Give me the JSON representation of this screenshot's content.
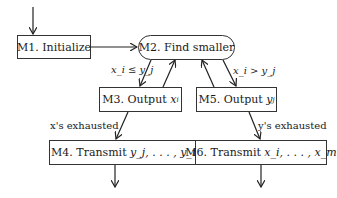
{
  "nodes": {
    "m1": {
      "label": "M1. Initialize"
    },
    "m2": {
      "label": "M2. Find smaller"
    },
    "m3": {
      "label_prefix": "M3. Output ",
      "label_var": "x",
      "label_sub": "i"
    },
    "m5": {
      "label_prefix": "M5. Output ",
      "label_var": "y",
      "label_sub": "j"
    },
    "m4": {
      "label_prefix": "M4. Transmit ",
      "label_math": "y_j, . . . , y_n"
    },
    "m6": {
      "label_prefix": "M6. Transmit ",
      "label_math": "x_i, . . . , x_m"
    }
  },
  "edge_labels": {
    "le": "x_i ≤ y_j",
    "gt": "x_i > y_j",
    "x_exhausted": "x's exhausted",
    "y_exhausted": "y's exhausted"
  }
}
